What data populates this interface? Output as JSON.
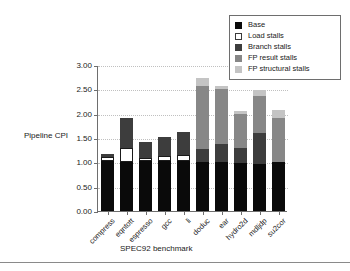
{
  "chart_data": {
    "type": "bar",
    "variant": "stacked",
    "title": "",
    "xlabel": "SPEC92 benchmark",
    "ylabel": "Pipeline CPI",
    "ylim": [
      0.0,
      3.0
    ],
    "ytick_step": 0.5,
    "ytick_labels": [
      "0.00",
      "0.50",
      "1.00",
      "1.50",
      "2.00",
      "2.50",
      "3.00"
    ],
    "ytick_values": [
      0.0,
      0.5,
      1.0,
      1.5,
      2.0,
      2.5,
      3.0
    ],
    "grid": "horizontal-dotted",
    "legend_position": "top-right",
    "categories": [
      "compress",
      "eqntott",
      "espresso",
      "gcc",
      "li",
      "doduc",
      "ear",
      "hydro2d",
      "mdljdp",
      "su2cor"
    ],
    "series": [
      {
        "name": "Base",
        "color": "#0a0a0a",
        "values": [
          1.02,
          1.0,
          1.03,
          1.02,
          1.02,
          1.0,
          1.0,
          0.99,
          0.97,
          1.0
        ]
      },
      {
        "name": "Load stalls",
        "color": "#ffffff",
        "values": [
          0.08,
          0.29,
          0.05,
          0.11,
          0.14,
          0.0,
          0.0,
          0.0,
          0.0,
          0.0
        ]
      },
      {
        "name": "Branch stalls",
        "color": "#3d3d3d",
        "values": [
          0.07,
          0.62,
          0.34,
          0.4,
          0.47,
          0.27,
          0.37,
          0.31,
          0.64,
          0.0
        ]
      },
      {
        "name": "FP result stalls",
        "color": "#878787",
        "values": [
          0.0,
          0.0,
          0.0,
          0.0,
          0.0,
          1.29,
          1.13,
          0.7,
          0.76,
          0.92
        ]
      },
      {
        "name": "FP structural stalls",
        "color": "#c4c4c4",
        "values": [
          0.0,
          0.0,
          0.0,
          0.0,
          0.0,
          0.17,
          0.06,
          0.06,
          0.12,
          0.15
        ]
      }
    ],
    "totals": [
      1.17,
      1.91,
      1.42,
      1.53,
      1.63,
      2.73,
      2.56,
      2.06,
      2.49,
      2.07
    ]
  },
  "legend": {
    "entries": [
      {
        "label": "Base"
      },
      {
        "label": "Load stalls"
      },
      {
        "label": "Branch stalls"
      },
      {
        "label": "FP result stalls"
      },
      {
        "label": "FP structural stalls"
      }
    ]
  }
}
